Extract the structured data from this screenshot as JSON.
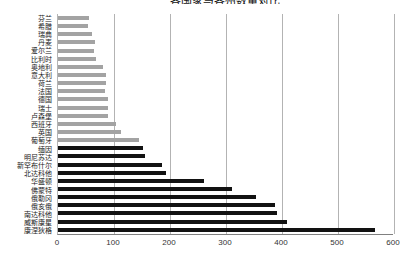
{
  "title": "各国家与各州数量对比",
  "chart_data": {
    "type": "bar",
    "orientation": "horizontal",
    "title": "各国家与各州数量对比",
    "xlabel": "",
    "ylabel": "",
    "xlim": [
      0,
      600
    ],
    "x_ticks": [
      0,
      100,
      200,
      300,
      400,
      500,
      600
    ],
    "grid": "vertical",
    "legend": "none",
    "categories": [
      "芬兰",
      "希腊",
      "瑞典",
      "丹麦",
      "爱尔兰",
      "比利时",
      "奥地利",
      "意大利",
      "荷兰",
      "法国",
      "德国",
      "瑞士",
      "卢森堡",
      "西班牙",
      "英国",
      "葡萄牙",
      "缅因",
      "明尼苏达",
      "新罕布什尔",
      "北达科他",
      "华盛顿",
      "佛蒙特",
      "俄勒冈",
      "俄亥俄",
      "南达科他",
      "威斯康星",
      "康涅狄格"
    ],
    "values": [
      56,
      54,
      61,
      67,
      64,
      68,
      80,
      86,
      86,
      85,
      90,
      90,
      89,
      104,
      112,
      145,
      152,
      156,
      186,
      193,
      261,
      312,
      354,
      388,
      392,
      410,
      568
    ],
    "groups": [
      "europe",
      "europe",
      "europe",
      "europe",
      "europe",
      "europe",
      "europe",
      "europe",
      "europe",
      "europe",
      "europe",
      "europe",
      "europe",
      "europe",
      "europe",
      "europe",
      "us",
      "us",
      "us",
      "us",
      "us",
      "us",
      "us",
      "us",
      "us",
      "us",
      "us"
    ],
    "colors": {
      "europe": "#a3a3a3",
      "us": "#121212"
    }
  }
}
